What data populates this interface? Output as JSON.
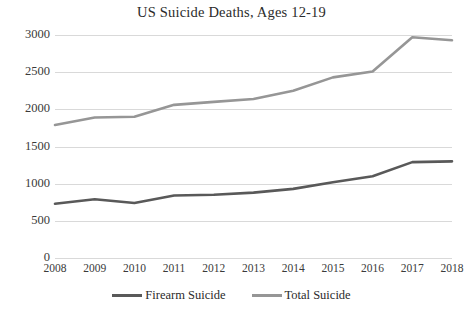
{
  "chart_data": {
    "type": "line",
    "title": "US Suicide Deaths, Ages 12-19",
    "xlabel": "",
    "ylabel": "",
    "categories": [
      "2008",
      "2009",
      "2010",
      "2011",
      "2012",
      "2013",
      "2014",
      "2015",
      "2016",
      "2017",
      "2018"
    ],
    "series": [
      {
        "name": "Firearm Suicide",
        "color": "#595959",
        "values": [
          730,
          790,
          740,
          840,
          850,
          880,
          930,
          1020,
          1100,
          1290,
          1300
        ]
      },
      {
        "name": "Total Suicide",
        "color": "#969696",
        "values": [
          1790,
          1890,
          1900,
          2060,
          2100,
          2140,
          2250,
          2430,
          2510,
          2970,
          2930
        ]
      }
    ],
    "ylim": [
      0,
      3000
    ],
    "yticks": [
      0,
      500,
      1000,
      1500,
      2000,
      2500,
      3000
    ],
    "ytick_labels": [
      "0",
      "500",
      "1000",
      "1500",
      "2000",
      "2500",
      "3000"
    ],
    "grid": "horizontal",
    "legend_position": "bottom"
  },
  "colors": {
    "gridline": "#d9d9d9",
    "text": "#2b2b2b",
    "background": "#ffffff"
  }
}
